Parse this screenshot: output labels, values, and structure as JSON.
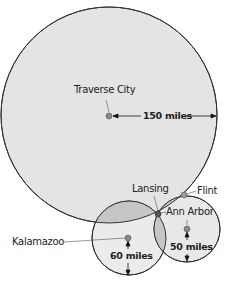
{
  "diagram": {
    "circles": [
      {
        "name": "Traverse City",
        "radius_label": "150 miles",
        "fill": "#e4e4e4"
      },
      {
        "name": "Kalamazoo",
        "radius_label": "60 miles",
        "fill": "#ebebeb"
      },
      {
        "name": "Ann Arbor",
        "radius_label": "50 miles",
        "fill": "#e8e8e8"
      }
    ],
    "points": {
      "traverse_city": "Traverse City",
      "kalamazoo": "Kalamazoo",
      "ann_arbor": "Ann Arbor",
      "lansing": "Lansing",
      "flint": "Flint"
    },
    "distances": {
      "traverse_city": "150 miles",
      "kalamazoo": "60 miles",
      "ann_arbor": "50 miles"
    },
    "colors": {
      "overlap": "#c6c6c6",
      "stroke": "#333333",
      "dot": "#888888"
    }
  }
}
